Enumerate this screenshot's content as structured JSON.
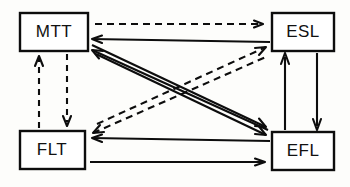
{
  "diagram": {
    "type": "directed-graph",
    "stroke_color": "#0d0d0d",
    "background_color": "#fdfdfb",
    "nodes": [
      {
        "id": "MTT",
        "label": "MTT",
        "position": "top-left",
        "x": 20,
        "y": 13,
        "w": 68,
        "h": 38
      },
      {
        "id": "ESL",
        "label": "ESL",
        "position": "top-right",
        "x": 272,
        "y": 13,
        "w": 62,
        "h": 38
      },
      {
        "id": "FLT",
        "label": "FLT",
        "position": "bottom-left",
        "x": 20,
        "y": 131,
        "w": 65,
        "h": 38
      },
      {
        "id": "EFL",
        "label": "EFL",
        "position": "bottom-right",
        "x": 272,
        "y": 132,
        "w": 62,
        "h": 38
      }
    ],
    "edges": [
      {
        "from": "MTT",
        "to": "ESL",
        "style": "dashed",
        "route": "top-horizontal"
      },
      {
        "from": "ESL",
        "to": "MTT",
        "style": "solid",
        "route": "horizontal"
      },
      {
        "from": "FLT",
        "to": "MTT",
        "style": "dashed",
        "route": "left-vertical-up"
      },
      {
        "from": "MTT",
        "to": "FLT",
        "style": "dashed",
        "route": "left-vertical-down"
      },
      {
        "from": "EFL",
        "to": "ESL",
        "style": "solid",
        "route": "right-vertical-up"
      },
      {
        "from": "ESL",
        "to": "EFL",
        "style": "solid",
        "route": "right-vertical-down"
      },
      {
        "from": "FLT",
        "to": "EFL",
        "style": "solid",
        "route": "bottom-horizontal"
      },
      {
        "from": "EFL",
        "to": "FLT",
        "style": "solid",
        "route": "horizontal"
      },
      {
        "from": "MTT",
        "to": "EFL",
        "style": "solid",
        "route": "diagonal-down-right"
      },
      {
        "from": "MTT",
        "to": "EFL",
        "style": "solid",
        "route": "diagonal-down-right-parallel"
      },
      {
        "from": "EFL",
        "to": "MTT",
        "style": "solid",
        "route": "diagonal-up-left"
      },
      {
        "from": "FLT",
        "to": "ESL",
        "style": "dashed",
        "route": "diagonal-up-right"
      },
      {
        "from": "FLT",
        "to": "ESL",
        "style": "dashed",
        "route": "diagonal-up-right-parallel"
      }
    ]
  }
}
